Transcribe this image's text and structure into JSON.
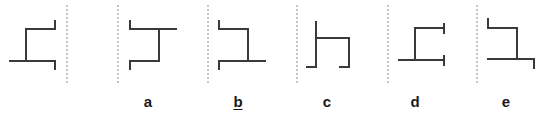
{
  "diagram": {
    "colors": {
      "stroke": "#3a3a3a",
      "divider": "#8a8a8a",
      "label": "#1a1a1a"
    },
    "reference": {
      "id": "reference"
    },
    "options": [
      {
        "id": "a",
        "label": "a",
        "underlined": false
      },
      {
        "id": "b",
        "label": "b",
        "underlined": true
      },
      {
        "id": "c",
        "label": "c",
        "underlined": false
      },
      {
        "id": "d",
        "label": "d",
        "underlined": false
      },
      {
        "id": "e",
        "label": "e",
        "underlined": false
      }
    ]
  }
}
